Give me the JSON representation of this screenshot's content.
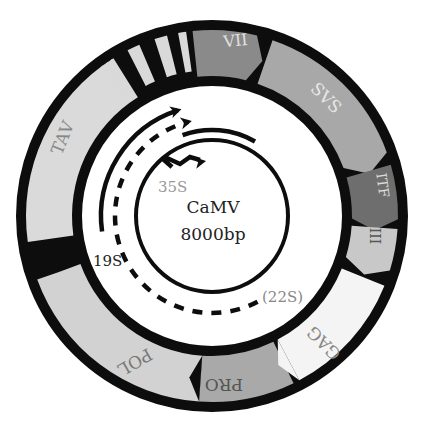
{
  "center": {
    "name": "CaMV",
    "size": "8000bp"
  },
  "transcripts": [
    {
      "label": "35S",
      "style": "promoter-arrow"
    },
    {
      "label": "19S",
      "style": "solid"
    },
    {
      "label": "(22S)",
      "style": "dashed"
    }
  ],
  "genes": [
    {
      "label": "VII",
      "color": "#8a8a8a",
      "text_color": "#e0e0e0"
    },
    {
      "label": "SVS",
      "color": "#a8a8a8",
      "text_color": "#e6e6e6"
    },
    {
      "label": "ITF",
      "color": "#6e6e6e",
      "text_color": "#dcdcdc"
    },
    {
      "label": "III",
      "color": "#c8c8c8",
      "text_color": "#555555"
    },
    {
      "label": "GAG",
      "color": "#f4f4f4",
      "text_color": "#888888"
    },
    {
      "label": "PRO",
      "color": "#a9a9a9",
      "text_color": "#555555"
    },
    {
      "label": "POL",
      "color": "#d2d2d2",
      "text_color": "#777777"
    },
    {
      "label": "TAV",
      "color": "#dadada",
      "text_color": "#888888"
    }
  ],
  "colors": {
    "ring": "#0d0d0d",
    "background": "#ffffff",
    "stripe": "#d9d9d9"
  }
}
